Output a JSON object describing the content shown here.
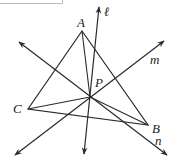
{
  "diagram": {
    "vertices": {
      "A": {
        "label": "A",
        "x": 82,
        "y": 31
      },
      "B": {
        "label": "B",
        "x": 148,
        "y": 125
      },
      "C": {
        "label": "C",
        "x": 28,
        "y": 109
      }
    },
    "point_P": {
      "label": "P",
      "x": 90,
      "y": 97
    },
    "lines": {
      "l": {
        "label": "ℓ"
      },
      "m": {
        "label": "m"
      },
      "n": {
        "label": "n"
      }
    },
    "colors": {
      "stroke": "#2a2a2a",
      "frame": "#bbbbbb"
    }
  }
}
